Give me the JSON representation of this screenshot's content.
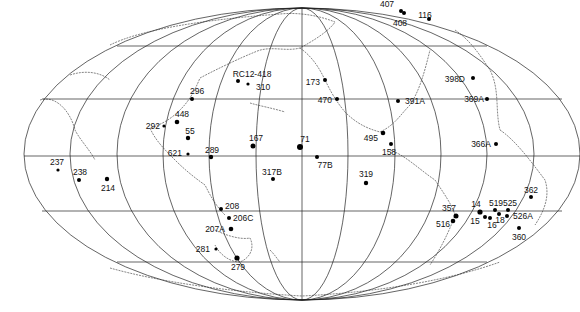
{
  "map": {
    "projection": "equal-area world (Pacific-centered)",
    "sites": [
      {
        "id": "407",
        "x": 401,
        "y": 11,
        "r": 2,
        "lx": 387,
        "ly": 7,
        "anchor": "middle"
      },
      {
        "id": "408",
        "x": 404,
        "y": 13,
        "r": 2,
        "lx": 400,
        "ly": 26,
        "anchor": "middle"
      },
      {
        "id": "116",
        "x": 429,
        "y": 19,
        "r": 2,
        "lx": 425,
        "ly": 18,
        "anchor": "middle"
      },
      {
        "id": "398D",
        "x": 473,
        "y": 78,
        "r": 2,
        "lx": 465,
        "ly": 82,
        "anchor": "end"
      },
      {
        "id": "369A",
        "x": 487,
        "y": 99,
        "r": 2,
        "lx": 484,
        "ly": 102,
        "anchor": "end"
      },
      {
        "id": "391A",
        "x": 398,
        "y": 101,
        "r": 2,
        "lx": 405,
        "ly": 104,
        "anchor": "start"
      },
      {
        "id": "366A",
        "x": 496,
        "y": 144,
        "r": 2,
        "lx": 491,
        "ly": 147,
        "anchor": "end"
      },
      {
        "id": "RC12-418",
        "x": 238,
        "y": 81,
        "r": 2,
        "lx": 252,
        "ly": 77,
        "anchor": "middle"
      },
      {
        "id": "310",
        "x": 248,
        "y": 84,
        "r": 1.6,
        "lx": 256,
        "ly": 90,
        "anchor": "start"
      },
      {
        "id": "173",
        "x": 325,
        "y": 80,
        "r": 2,
        "lx": 320,
        "ly": 85,
        "anchor": "end"
      },
      {
        "id": "470",
        "x": 337,
        "y": 99,
        "r": 2,
        "lx": 332,
        "ly": 103,
        "anchor": "end"
      },
      {
        "id": "495",
        "x": 383,
        "y": 133,
        "r": 2.3,
        "lx": 378,
        "ly": 141,
        "anchor": "end"
      },
      {
        "id": "158",
        "x": 391,
        "y": 144,
        "r": 2,
        "lx": 389,
        "ly": 155,
        "anchor": "middle"
      },
      {
        "id": "296",
        "x": 192,
        "y": 99,
        "r": 2,
        "lx": 190,
        "ly": 94,
        "anchor": "start"
      },
      {
        "id": "448",
        "x": 177,
        "y": 122,
        "r": 2.3,
        "lx": 182,
        "ly": 117,
        "anchor": "middle"
      },
      {
        "id": "292",
        "x": 164,
        "y": 126,
        "r": 1.6,
        "lx": 160,
        "ly": 129,
        "anchor": "end"
      },
      {
        "id": "55",
        "x": 188,
        "y": 138,
        "r": 2.2,
        "lx": 190,
        "ly": 134,
        "anchor": "middle"
      },
      {
        "id": "621",
        "x": 188,
        "y": 154,
        "r": 1.6,
        "lx": 182,
        "ly": 156,
        "anchor": "end"
      },
      {
        "id": "289",
        "x": 211,
        "y": 157,
        "r": 2.2,
        "lx": 212,
        "ly": 153,
        "anchor": "middle"
      },
      {
        "id": "167",
        "x": 253,
        "y": 146,
        "r": 2.5,
        "lx": 256,
        "ly": 141,
        "anchor": "middle"
      },
      {
        "id": "71",
        "x": 300,
        "y": 147,
        "r": 3,
        "lx": 305,
        "ly": 142,
        "anchor": "middle"
      },
      {
        "id": "77B",
        "x": 317,
        "y": 157,
        "r": 2,
        "lx": 325,
        "ly": 168,
        "anchor": "middle"
      },
      {
        "id": "317B",
        "x": 273,
        "y": 179,
        "r": 2,
        "lx": 272,
        "ly": 175,
        "anchor": "middle"
      },
      {
        "id": "319",
        "x": 366,
        "y": 183,
        "r": 2.2,
        "lx": 366,
        "ly": 177,
        "anchor": "middle"
      },
      {
        "id": "237",
        "x": 58,
        "y": 170,
        "r": 1.6,
        "lx": 57,
        "ly": 165,
        "anchor": "middle"
      },
      {
        "id": "238",
        "x": 79,
        "y": 180,
        "r": 2,
        "lx": 80,
        "ly": 175,
        "anchor": "middle"
      },
      {
        "id": "214",
        "x": 107,
        "y": 179,
        "r": 2.2,
        "lx": 108,
        "ly": 191,
        "anchor": "middle"
      },
      {
        "id": "208",
        "x": 221,
        "y": 209,
        "r": 2,
        "lx": 225,
        "ly": 209,
        "anchor": "start"
      },
      {
        "id": "206C",
        "x": 229,
        "y": 218,
        "r": 2,
        "lx": 233,
        "ly": 221,
        "anchor": "start"
      },
      {
        "id": "207A",
        "x": 231,
        "y": 229,
        "r": 2.3,
        "lx": 225,
        "ly": 232,
        "anchor": "end"
      },
      {
        "id": "281",
        "x": 216,
        "y": 249,
        "r": 1.6,
        "lx": 210,
        "ly": 252,
        "anchor": "end"
      },
      {
        "id": "279",
        "x": 237,
        "y": 258,
        "r": 2.6,
        "lx": 238,
        "ly": 270,
        "anchor": "middle"
      },
      {
        "id": "357",
        "x": 456,
        "y": 216,
        "r": 2.5,
        "lx": 449,
        "ly": 211,
        "anchor": "middle"
      },
      {
        "id": "516",
        "x": 453,
        "y": 221,
        "r": 2.3,
        "lx": 443,
        "ly": 227,
        "anchor": "middle"
      },
      {
        "id": "14",
        "x": 480,
        "y": 212,
        "r": 2.6,
        "lx": 476,
        "ly": 207,
        "anchor": "middle"
      },
      {
        "id": "15",
        "x": 485,
        "y": 217,
        "r": 2,
        "lx": 475,
        "ly": 224,
        "anchor": "middle"
      },
      {
        "id": "16",
        "x": 490,
        "y": 218,
        "r": 2,
        "lx": 492,
        "ly": 228,
        "anchor": "middle"
      },
      {
        "id": "519",
        "x": 495,
        "y": 210,
        "r": 2,
        "lx": 496,
        "ly": 206,
        "anchor": "middle"
      },
      {
        "id": "18",
        "x": 499,
        "y": 214,
        "r": 2,
        "lx": 500,
        "ly": 223,
        "anchor": "middle"
      },
      {
        "id": "525",
        "x": 508,
        "y": 210,
        "r": 2,
        "lx": 510,
        "ly": 206,
        "anchor": "middle"
      },
      {
        "id": "526A",
        "x": 507,
        "y": 216,
        "r": 2,
        "lx": 513,
        "ly": 219,
        "anchor": "start"
      },
      {
        "id": "362",
        "x": 531,
        "y": 197,
        "r": 2,
        "lx": 531,
        "ly": 193,
        "anchor": "middle"
      },
      {
        "id": "360",
        "x": 519,
        "y": 228,
        "r": 2,
        "lx": 519,
        "ly": 240,
        "anchor": "middle"
      }
    ]
  }
}
